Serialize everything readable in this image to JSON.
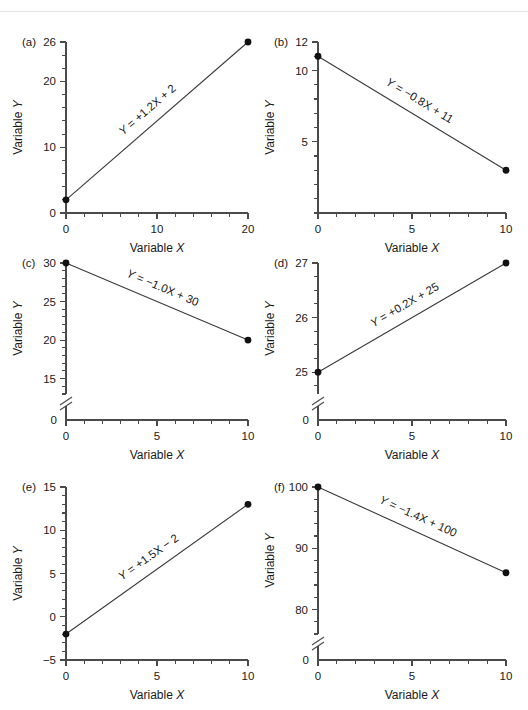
{
  "figure": {
    "name": "six-panel-linear-regression-figure",
    "panel_count": 6,
    "axis_title_x": "Variable X",
    "axis_title_y": "Variable Y",
    "line_color": "#3a3a3a",
    "point_color": "#111111",
    "axis_color": "#4a4a4a"
  },
  "chart_data": [
    {
      "type": "line",
      "panel": "(a)",
      "title": "",
      "xlabel": "Variable X",
      "ylabel": "Variable Y",
      "annotation": "Y = +1.2X + 2",
      "slope": 1.2,
      "intercept": 2,
      "x": [
        0,
        20
      ],
      "values": [
        2,
        26
      ],
      "xlim": [
        0,
        20
      ],
      "ylim": [
        0,
        26
      ],
      "xticks": [
        0,
        10,
        20
      ],
      "xticklabels": [
        "0",
        "10",
        "20"
      ],
      "xminor_step": 2,
      "yticks": [
        0,
        10,
        20,
        26
      ],
      "yticklabels": [
        "0",
        "10",
        "20",
        "26"
      ],
      "yminor_step": 2,
      "axis_break": false,
      "grid": false,
      "legend": "none"
    },
    {
      "type": "line",
      "panel": "(b)",
      "title": "",
      "xlabel": "Variable X",
      "ylabel": "Variable Y",
      "annotation": "Y = −0.8X + 11",
      "slope": -0.8,
      "intercept": 11,
      "x": [
        0,
        10
      ],
      "values": [
        11,
        3
      ],
      "xlim": [
        0,
        10
      ],
      "ylim": [
        0,
        12
      ],
      "xticks": [
        0,
        5,
        10
      ],
      "xticklabels": [
        "0",
        "5",
        "10"
      ],
      "xminor_step": 1,
      "yticks": [
        5,
        10,
        12
      ],
      "yticklabels": [
        "5",
        "10",
        "12"
      ],
      "yminor_step": 1,
      "axis_break": false,
      "grid": false,
      "legend": "none"
    },
    {
      "type": "line",
      "panel": "(c)",
      "title": "",
      "xlabel": "Variable X",
      "ylabel": "Variable Y",
      "annotation": "Y = −1.0X + 30",
      "slope": -1.0,
      "intercept": 30,
      "x": [
        0,
        10
      ],
      "values": [
        30,
        20
      ],
      "xlim": [
        0,
        10
      ],
      "ylim": [
        13,
        30
      ],
      "xticks": [
        0,
        5,
        10
      ],
      "xticklabels": [
        "0",
        "5",
        "10"
      ],
      "xminor_step": 1,
      "yticks": [
        15,
        20,
        25,
        30
      ],
      "yticklabels": [
        "15",
        "20",
        "25",
        "30"
      ],
      "yminor_step": 1,
      "zero_label": "0",
      "axis_break": true,
      "grid": false,
      "legend": "none"
    },
    {
      "type": "line",
      "panel": "(d)",
      "title": "",
      "xlabel": "Variable X",
      "ylabel": "Variable Y",
      "annotation": "Y = +0.2X + 25",
      "slope": 0.2,
      "intercept": 25,
      "x": [
        0,
        10
      ],
      "values": [
        25,
        27
      ],
      "xlim": [
        0,
        10
      ],
      "ylim": [
        24.6,
        27
      ],
      "xticks": [
        0,
        5,
        10
      ],
      "xticklabels": [
        "0",
        "5",
        "10"
      ],
      "xminor_step": 1,
      "yticks": [
        25,
        26,
        27
      ],
      "yticklabels": [
        "25",
        "26",
        "27"
      ],
      "yminor_step": 0.25,
      "zero_label": "0",
      "axis_break": true,
      "grid": false,
      "legend": "none"
    },
    {
      "type": "line",
      "panel": "(e)",
      "title": "",
      "xlabel": "Variable X",
      "ylabel": "Variable Y",
      "annotation": "Y = +1.5X − 2",
      "slope": 1.5,
      "intercept": -2,
      "x": [
        0,
        10
      ],
      "values": [
        -2,
        13
      ],
      "xlim": [
        0,
        10
      ],
      "ylim": [
        -5,
        15
      ],
      "xticks": [
        0,
        5,
        10
      ],
      "xticklabels": [
        "0",
        "5",
        "10"
      ],
      "xminor_step": 1,
      "yticks": [
        -5,
        0,
        5,
        10,
        15
      ],
      "yticklabels": [
        "−5",
        "0",
        "5",
        "10",
        "15"
      ],
      "yminor_step": 1,
      "axis_break": false,
      "grid": false,
      "legend": "none"
    },
    {
      "type": "line",
      "panel": "(f)",
      "title": "",
      "xlabel": "Variable X",
      "ylabel": "Variable Y",
      "annotation": "Y = −1.4X + 100",
      "slope": -1.4,
      "intercept": 100,
      "x": [
        0,
        10
      ],
      "values": [
        100,
        86
      ],
      "xlim": [
        0,
        10
      ],
      "ylim": [
        76,
        100
      ],
      "xticks": [
        0,
        5,
        10
      ],
      "xticklabels": [
        "0",
        "5",
        "10"
      ],
      "xminor_step": 1,
      "yticks": [
        80,
        90,
        100
      ],
      "yticklabels": [
        "80",
        "90",
        "100"
      ],
      "yminor_step": 2,
      "zero_label": "0",
      "axis_break": true,
      "grid": false,
      "legend": "none"
    }
  ]
}
